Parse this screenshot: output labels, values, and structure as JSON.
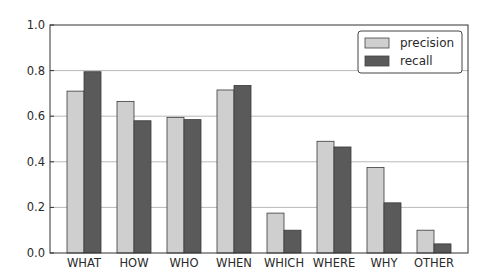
{
  "chart_data": {
    "type": "bar",
    "title": "",
    "xlabel": "",
    "ylabel": "",
    "categories": [
      "WHAT",
      "HOW",
      "WHO",
      "WHEN",
      "WHICH",
      "WHERE",
      "WHY",
      "OTHER"
    ],
    "series": [
      {
        "name": "precision",
        "color": "#cfcfcf",
        "values": [
          0.71,
          0.665,
          0.595,
          0.715,
          0.175,
          0.49,
          0.375,
          0.1
        ]
      },
      {
        "name": "recall",
        "color": "#5a5a5a",
        "values": [
          0.795,
          0.58,
          0.585,
          0.735,
          0.1,
          0.465,
          0.22,
          0.04
        ]
      }
    ],
    "ylim": [
      0.0,
      1.0
    ],
    "yticks": [
      "0.0",
      "0.2",
      "0.4",
      "0.6",
      "0.8",
      "1.0"
    ],
    "grid": true,
    "legend_position": "upper right"
  },
  "legend": {
    "items": [
      {
        "label": "precision",
        "color": "#cfcfcf"
      },
      {
        "label": "recall",
        "color": "#5a5a5a"
      }
    ]
  }
}
